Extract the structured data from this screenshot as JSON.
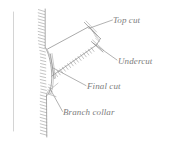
{
  "figure": {
    "style": "faded grayscale pen-and-ink line drawing",
    "background_color": "#ffffff",
    "line_color": "#8a8a8a",
    "text_color": "#7d7d7d"
  },
  "labels": {
    "top_cut": "Top cut",
    "undercut": "Undercut",
    "final_cut": "Final cut",
    "branch_collar": "Branch collar"
  },
  "parts": {
    "trunk": "tree trunk with vertical bark hatching",
    "branch": "angled branch with bark hatching",
    "margin_rule": "faint vertical page rule at left"
  }
}
